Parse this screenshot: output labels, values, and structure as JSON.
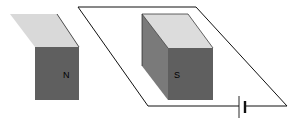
{
  "diagram": {
    "magnets": [
      {
        "id": "left",
        "pole_label": "N",
        "top_color": "#d9d9d9",
        "front_color": "#5f5f5f"
      },
      {
        "id": "right",
        "pole_label": "S",
        "top_color": "#dcdcdc",
        "side_color": "#7a7a7a",
        "front_color": "#5f5f5f"
      }
    ],
    "circuit": {
      "element": "battery",
      "wire_color": "#111111"
    }
  }
}
